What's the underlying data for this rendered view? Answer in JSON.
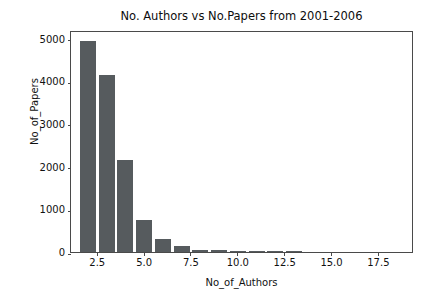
{
  "chart_data": {
    "type": "bar",
    "title": "No. Authors vs No.Papers from 2001-2006",
    "xlabel": "No_of_Authors",
    "ylabel": "No_of_Papers",
    "grid": false,
    "legend": null,
    "bar_color": "#565b5e",
    "bar_width": 0.85,
    "xlim": [
      1.1,
      19.4
    ],
    "ylim": [
      0,
      5200
    ],
    "xticks": [
      "2.5",
      "5.0",
      "7.5",
      "10.0",
      "12.5",
      "15.0",
      "17.5"
    ],
    "xtick_values": [
      2.5,
      5.0,
      7.5,
      10.0,
      12.5,
      15.0,
      17.5
    ],
    "yticks": [
      "0",
      "1000",
      "2000",
      "3000",
      "4000",
      "5000"
    ],
    "ytick_values": [
      0,
      1000,
      2000,
      3000,
      4000,
      5000
    ],
    "x": [
      2,
      3,
      4,
      5,
      6,
      7,
      8,
      9,
      10,
      11,
      12,
      13
    ],
    "values": [
      4950,
      4140,
      2160,
      740,
      310,
      140,
      45,
      40,
      30,
      20,
      12,
      8
    ],
    "categories": [
      "2",
      "3",
      "4",
      "5",
      "6",
      "7",
      "8",
      "9",
      "10",
      "11",
      "12",
      "13"
    ]
  }
}
